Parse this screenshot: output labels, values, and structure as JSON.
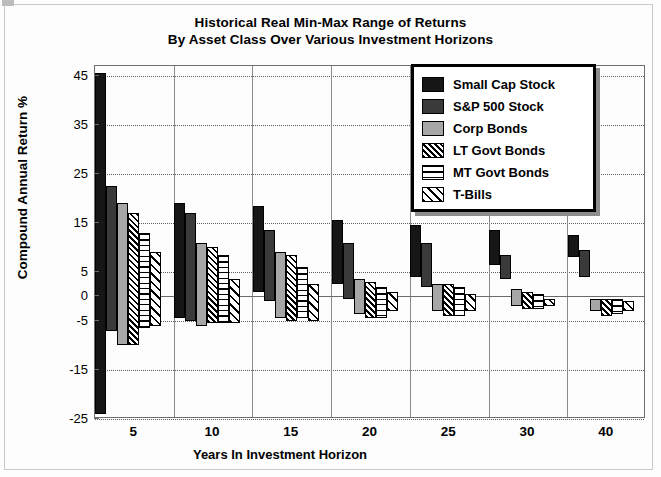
{
  "chart_data": {
    "type": "bar",
    "subtype": "floating min-max range bars",
    "title": "Historical Real Min-Max Range of Returns",
    "subtitle": "By Asset Class Over Various Investment Horizons",
    "xlabel": "Years In Investment Horizon",
    "ylabel": "Compound Annual Return %",
    "categories": [
      "5",
      "10",
      "15",
      "20",
      "25",
      "30",
      "40"
    ],
    "ylim": [
      -25,
      47
    ],
    "yticks": [
      45,
      35,
      25,
      15,
      5,
      0,
      -5,
      -15,
      -25
    ],
    "ytick_labels": [
      "45",
      "35",
      "25",
      "15",
      "5",
      "0",
      "-5",
      "-15",
      "-25"
    ],
    "grid": "horizontal dotted gridlines at 10% intervals; solid vertical separators between horizon groups; solid zero line",
    "legend_position": "top-right inside plot",
    "series": [
      {
        "name": "Small Cap Stock",
        "fill": "solid-black",
        "color": "#161616",
        "min": [
          -24.0,
          -4.5,
          1.0,
          2.5,
          4.0,
          6.5,
          8.0
        ],
        "max": [
          45.5,
          19.0,
          18.5,
          15.5,
          14.5,
          13.5,
          12.5
        ]
      },
      {
        "name": "S&P 500 Stock",
        "fill": "solid-dark-gray",
        "color": "#3a3a3a",
        "min": [
          -7.0,
          -5.0,
          -1.0,
          -0.5,
          2.0,
          3.5,
          4.0
        ],
        "max": [
          22.5,
          17.0,
          13.5,
          11.0,
          11.0,
          8.5,
          9.5
        ]
      },
      {
        "name": "Corp Bonds",
        "fill": "solid-mid-gray",
        "color": "#a6a6a6",
        "min": [
          -10.0,
          -6.0,
          -4.5,
          -3.5,
          -3.0,
          -2.0,
          -3.0
        ],
        "max": [
          19.0,
          11.0,
          9.0,
          3.5,
          2.5,
          1.5,
          -0.5
        ]
      },
      {
        "name": "LT Govt Bonds",
        "fill": "dense-diagonal-hatch",
        "color": "#ffffff",
        "min": [
          -10.0,
          -5.5,
          -5.0,
          -4.5,
          -4.0,
          -2.5,
          -4.0
        ],
        "max": [
          17.0,
          10.0,
          8.5,
          3.0,
          2.5,
          1.0,
          -0.5
        ]
      },
      {
        "name": "MT Govt Bonds",
        "fill": "horizontal-lines",
        "color": "#ffffff",
        "min": [
          -6.5,
          -5.5,
          -4.5,
          -4.5,
          -4.0,
          -2.5,
          -3.5
        ],
        "max": [
          13.0,
          8.5,
          6.0,
          2.0,
          2.0,
          0.5,
          -0.5
        ]
      },
      {
        "name": "T-Bills",
        "fill": "light-diagonal-hatch",
        "color": "#ffffff",
        "min": [
          -6.0,
          -5.5,
          -5.0,
          -3.0,
          -3.0,
          -2.0,
          -3.0
        ],
        "max": [
          9.0,
          3.5,
          2.5,
          1.0,
          0.5,
          -0.5,
          -1.0
        ]
      }
    ]
  },
  "legend": {
    "items": [
      {
        "label": "Small Cap Stock",
        "swatch": "solid-black-swatch"
      },
      {
        "label": "S&P 500 Stock",
        "swatch": "solid-dark-gray-swatch"
      },
      {
        "label": "Corp Bonds",
        "swatch": "solid-mid-gray-swatch"
      },
      {
        "label": "LT Govt Bonds",
        "swatch": "dense-hatch-swatch"
      },
      {
        "label": "MT Govt Bonds",
        "swatch": "horizontal-lines-swatch"
      },
      {
        "label": "T-Bills",
        "swatch": "light-hatch-swatch"
      }
    ]
  }
}
